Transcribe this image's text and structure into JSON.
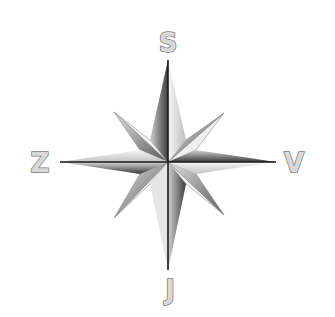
{
  "diagram": {
    "type": "compass-rose",
    "labels": {
      "top": "S",
      "left": "Z",
      "right": "V",
      "bottom": "J"
    },
    "colors": {
      "background": "#ffffff",
      "light": "#f2f2f2",
      "mid": "#b5b5b5",
      "dark": "#4a4a4a",
      "line": "#1a1a1a",
      "label_fill": "#d8d8d8",
      "label_stroke": "#777777"
    }
  }
}
